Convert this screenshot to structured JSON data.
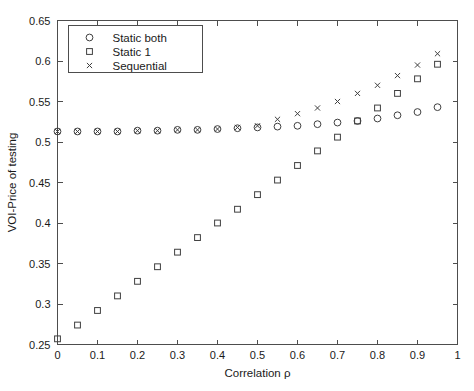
{
  "chart_data": {
    "type": "scatter",
    "title": "",
    "xlabel": "Correlation ρ",
    "ylabel": "VOI-Price of testing",
    "xlim": [
      0,
      1
    ],
    "ylim": [
      0.25,
      0.65
    ],
    "xticks": [
      "0",
      "0.1",
      "0.2",
      "0.3",
      "0.4",
      "0.5",
      "0.6",
      "0.7",
      "0.8",
      "0.9",
      "1"
    ],
    "xtick_values": [
      0,
      0.1,
      0.2,
      0.3,
      0.4,
      0.5,
      0.6,
      0.7,
      0.8,
      0.9,
      1
    ],
    "yticks": [
      "0.25",
      "0.3",
      "0.35",
      "0.4",
      "0.45",
      "0.5",
      "0.55",
      "0.6",
      "0.65"
    ],
    "ytick_values": [
      0.25,
      0.3,
      0.35,
      0.4,
      0.45,
      0.5,
      0.55,
      0.6,
      0.65
    ],
    "grid": false,
    "legend_position": "upper left",
    "x": [
      0,
      0.05,
      0.1,
      0.15,
      0.2,
      0.25,
      0.3,
      0.35,
      0.4,
      0.45,
      0.5,
      0.55,
      0.6,
      0.65,
      0.7,
      0.75,
      0.8,
      0.85,
      0.9,
      0.95
    ],
    "series": [
      {
        "name": "Static both",
        "marker": "circle",
        "values": [
          0.513,
          0.513,
          0.513,
          0.513,
          0.514,
          0.514,
          0.515,
          0.515,
          0.516,
          0.517,
          0.518,
          0.519,
          0.52,
          0.522,
          0.524,
          0.526,
          0.529,
          0.533,
          0.537,
          0.543
        ]
      },
      {
        "name": "Static 1",
        "marker": "square",
        "values": [
          0.257,
          0.274,
          0.292,
          0.31,
          0.328,
          0.346,
          0.364,
          0.382,
          0.4,
          0.417,
          0.435,
          0.453,
          0.471,
          0.489,
          0.506,
          0.526,
          0.542,
          0.56,
          0.578,
          0.596
        ]
      },
      {
        "name": "Sequential",
        "marker": "cross",
        "values": [
          0.513,
          0.513,
          0.513,
          0.513,
          0.514,
          0.514,
          0.515,
          0.515,
          0.516,
          0.518,
          0.52,
          0.528,
          0.535,
          0.542,
          0.55,
          0.56,
          0.57,
          0.582,
          0.595,
          0.609
        ]
      }
    ]
  },
  "legend": {
    "items": [
      {
        "label": "Static both",
        "marker": "circle"
      },
      {
        "label": "Static 1",
        "marker": "square"
      },
      {
        "label": "Sequential",
        "marker": "cross"
      }
    ]
  },
  "colors": {
    "axis": "#4d4d4d",
    "marker": "#3f3f3f",
    "text": "#1a1a1a",
    "background": "#ffffff"
  }
}
